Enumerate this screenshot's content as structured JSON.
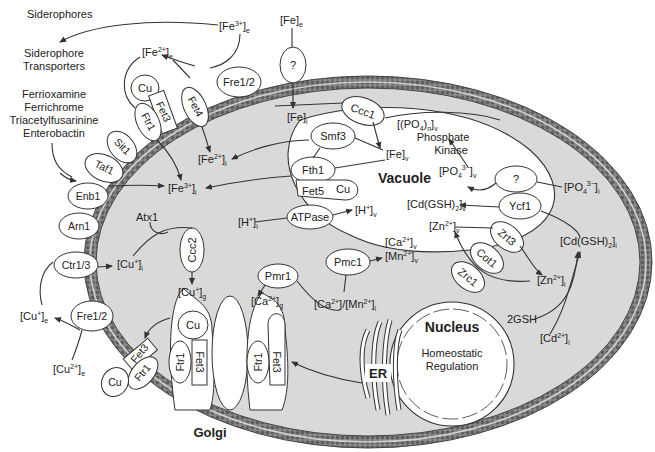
{
  "diagram": {
    "colors": {
      "cytoplasm": "#d9d9d9",
      "membrane": "#6a6a6a",
      "organelle": "#ffffff",
      "line": "#333333"
    },
    "compartments": {
      "vacuole": "Vacuole",
      "nucleus": "Nucleus",
      "nucleus_note_1": "Homeostatic",
      "nucleus_note_2": "Regulation",
      "golgi": "Golgi",
      "er": "ER"
    },
    "external": {
      "siderophores": "Siderophores",
      "siderophore_transporters_1": "Siderophore",
      "siderophore_transporters_2": "Transporters",
      "siderophore_list": [
        "Ferrioxamine",
        "Ferrichrome",
        "Triacetylfusarinine",
        "Enterobactin"
      ],
      "fe3_e": {
        "base": "[Fe",
        "sup": "3+",
        "close": "]",
        "sub": "e"
      },
      "fe2_e": {
        "base": "[Fe",
        "sup": "2+",
        "close": "]",
        "sub": "e"
      },
      "fe_e": {
        "base": "[Fe]",
        "sub": "e"
      },
      "cu1_e": {
        "base": "[Cu",
        "sup": "+",
        "close": "]",
        "sub": "e"
      },
      "cu2_e": {
        "base": "[Cu",
        "sup": "2+",
        "close": "]",
        "sub": "e"
      }
    },
    "cytoplasm_species": {
      "fe_i": {
        "base": "[Fe]",
        "sub": "i"
      },
      "fe2_i": {
        "base": "[Fe",
        "sup": "2+",
        "close": "]",
        "sub": "i"
      },
      "fe3_i": {
        "base": "[Fe",
        "sup": "3+",
        "close": "]",
        "sub": "i"
      },
      "cu1_i": {
        "base": "[Cu",
        "sup": "+",
        "close": "]",
        "sub": "i"
      },
      "h_i": {
        "base": "[H",
        "sup": "+",
        "close": "]",
        "sub": "i"
      },
      "ca_mn_i": {
        "text": "[Ca2+]/[Mn2+]i"
      },
      "zn_i": {
        "base": "[Zn",
        "sup": "2+",
        "close": "]",
        "sub": "i"
      },
      "cd_i": {
        "base": "[Cd",
        "sup": "2+",
        "close": "]",
        "sub": "i"
      },
      "cdgsh_i": {
        "base": "[Cd(GSH)",
        "sub2": "2",
        "close": "]",
        "sub": "i"
      },
      "po4_i": {
        "base": "[PO",
        "sub2": "4",
        "sup": "3−",
        "close": "]",
        "sub": "i"
      },
      "gsh": "2GSH",
      "atx1": "Atx1"
    },
    "vacuole_species": {
      "fe_v": {
        "base": "[Fe]",
        "sub": "v"
      },
      "po4n_v": {
        "base": "[(PO",
        "sub2": "4",
        "mid": ")",
        "sub3": "n",
        "close": "]",
        "sub": "v"
      },
      "po4_v": {
        "base": "[PO",
        "sub2": "4",
        "sup": "3−",
        "close": "]",
        "sub": "v"
      },
      "phosphate_kinase_1": "Phosphate",
      "phosphate_kinase_2": "Kinase",
      "cdgsh_v": {
        "base": "[Cd(GSH)",
        "sub2": "2",
        "close": "]",
        "sub": "v"
      },
      "zn_v": {
        "base": "[Zn",
        "sup": "2+",
        "close": "]",
        "sub": "v"
      },
      "ca_v": {
        "base": "[Ca",
        "sup": "2+",
        "close": "]",
        "sub": "v"
      },
      "mn_v": {
        "base": "[Mn",
        "sup": "2+",
        "close": "]",
        "sub": "v"
      },
      "h_v": {
        "base": "[H",
        "sup": "+",
        "close": "]",
        "sub": "v"
      }
    },
    "golgi_species": {
      "cu_g": {
        "base": "[Cu",
        "sup": "+",
        "close": "]",
        "sub": "g"
      },
      "ca_g": {
        "base": "[Ca",
        "sup": "2+",
        "close": "]",
        "sub": "g"
      }
    },
    "proteins": {
      "fre12_top": "Fre1/2",
      "unknown_fe": "?",
      "fet4": "Fet4",
      "cu_top": "Cu",
      "fet3_top": "Fet3",
      "ftr1_top": "Ftr1",
      "sit1": "Sit1",
      "taf1": "Taf1",
      "enb1": "Enb1",
      "arn1": "Arn1",
      "ctr13": "Ctr1/3",
      "fre12_bottom": "Fre1/2",
      "fet3_bottom": "Fet3",
      "ftr1_bottom": "Ftr1",
      "cu_bottom": "Cu",
      "ccc1": "Ccc1",
      "smf3": "Smf3",
      "fth1": "Fth1",
      "fet5": "Fet5",
      "cu_vac": "Cu",
      "atpase": "ATPase",
      "pmc1": "Pmc1",
      "unknown_po4": "?",
      "ycf1": "Ycf1",
      "zrt3": "Zrt3",
      "cot1": "Cot1",
      "zrc1": "Zrc1",
      "ccc2": "Ccc2",
      "pmr1": "Pmr1",
      "golgi_cu_1": "Cu",
      "golgi_ftr1_1": "Ftr1",
      "golgi_fet3_1": "Fet3",
      "golgi_ftr1_2": "Ftr1",
      "golgi_fet3_2": "Fet3"
    }
  }
}
